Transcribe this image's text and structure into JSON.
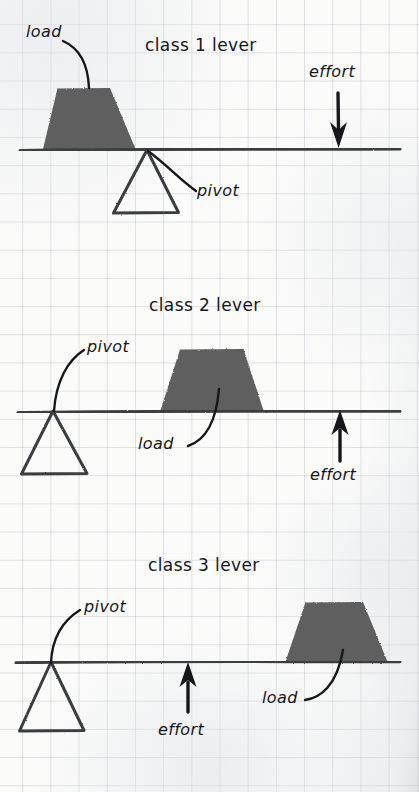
{
  "page": {
    "background_color": "#fbfbfa",
    "grid_color": "#96a0af",
    "ink_color": "#15171a",
    "load_fill_color": "#5e5e5e",
    "lever_color": "#3a3c40"
  },
  "diagram": {
    "panels": [
      {
        "id": "class-1",
        "title": "class 1 lever",
        "labels": {
          "load": "load",
          "pivot": "pivot",
          "effort": "effort"
        },
        "arrangement": {
          "load_side": "left",
          "pivot_position": "center",
          "effort_side": "right",
          "effort_direction": "down"
        }
      },
      {
        "id": "class-2",
        "title": "class 2 lever",
        "labels": {
          "load": "load",
          "pivot": "pivot",
          "effort": "effort"
        },
        "arrangement": {
          "pivot_position": "left",
          "load_side": "center",
          "effort_side": "right",
          "effort_direction": "up"
        }
      },
      {
        "id": "class-3",
        "title": "class 3 lever",
        "labels": {
          "load": "load",
          "pivot": "pivot",
          "effort": "effort"
        },
        "arrangement": {
          "pivot_position": "left",
          "effort_side": "center",
          "load_side": "right",
          "effort_direction": "up"
        }
      }
    ]
  }
}
